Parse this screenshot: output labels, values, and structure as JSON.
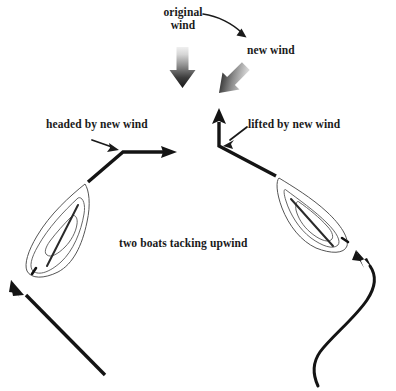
{
  "diagram": {
    "title": "two boats tacking upwind",
    "labels": {
      "original_wind": "original\nwind",
      "original_wind_line1": "original",
      "original_wind_line2": "wind",
      "new_wind": "new wind",
      "headed_by_new_wind": "headed by new wind",
      "lifted_by_new_wind": "lifted by new wind",
      "two_boats_tacking_upwind": "two boats tacking upwind"
    },
    "colors": {
      "ink": "#1a1a1a",
      "track": "#141414",
      "hull_outline": "#4d4d4d",
      "wind_arrow_light": "#e8e8e8",
      "wind_arrow_dark": "#1f1f1f",
      "background": "#ffffff"
    },
    "elements": [
      {
        "name": "original-wind-block-arrow",
        "direction": "down",
        "angle_deg": 180
      },
      {
        "name": "new-wind-block-arrow",
        "direction": "down-left",
        "angle_deg": 225
      },
      {
        "name": "original-wind-curved-arrow",
        "from": "original wind label",
        "to": "new wind arrow"
      },
      {
        "name": "left-boat",
        "heading": "up-right",
        "tack": "port"
      },
      {
        "name": "right-boat",
        "heading": "up-left",
        "tack": "starboard"
      },
      {
        "name": "left-boat-track-before",
        "shape": "straight",
        "direction": "up-left"
      },
      {
        "name": "left-boat-track-after",
        "shape": "bent",
        "description": "diagonal up-right then horizontal right"
      },
      {
        "name": "right-boat-track-before",
        "shape": "curved-s",
        "direction": "up"
      },
      {
        "name": "right-boat-track-after",
        "shape": "bent",
        "description": "diagonal up-left then straight up"
      },
      {
        "name": "headed-pointer-arrow",
        "points_to": "left boat track bend"
      },
      {
        "name": "lifted-pointer-arrow",
        "points_to": "right boat track bend"
      }
    ]
  }
}
